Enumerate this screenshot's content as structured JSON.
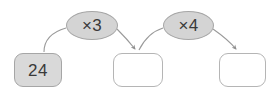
{
  "diagram": {
    "type": "function-machine-chain",
    "title": "",
    "stroke_color": "#9a9a9a",
    "filled_node_color": "#d9d9d9",
    "operator_node_color": "#d4d4d4",
    "empty_node_color": "#ffffff",
    "text_color": "#3a3a3a",
    "nodes": [
      {
        "id": "node-1",
        "value": "24",
        "state": "filled"
      },
      {
        "id": "node-2",
        "value": "",
        "state": "empty"
      },
      {
        "id": "node-3",
        "value": "",
        "state": "empty"
      }
    ],
    "operators": [
      {
        "id": "op-1",
        "label": "×3"
      },
      {
        "id": "op-2",
        "label": "×4"
      }
    ]
  }
}
